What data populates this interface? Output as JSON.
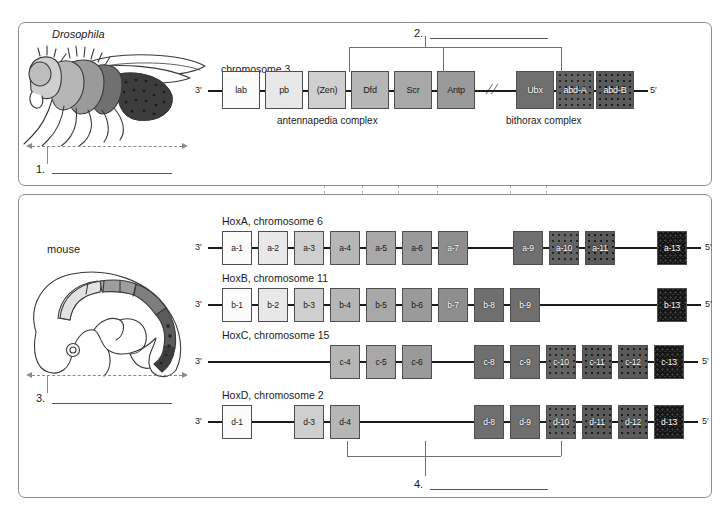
{
  "figure": {
    "title_caption": "",
    "organisms": {
      "fly": "Drosophila",
      "mouse": "mouse"
    }
  },
  "colors": {
    "stroke": "#4f4f4f",
    "guide": "#b5b5b5",
    "bracket": "#6f6f6f",
    "backbone": "#1b1b1b",
    "shade_1": "#fbfbfb",
    "shade_2": "#e8e8e8",
    "shade_3": "#cfcfcf",
    "shade_4": "#b6b6b6",
    "shade_5": "#a8a8a8",
    "shade_6": "#9a9a9a",
    "shade_7": "#8e8e8e",
    "shade_8": "#6f6f6f",
    "shade_9": "#636363",
    "shade_dot": "#5a5a5a",
    "shade_check": "#3a3a3a"
  },
  "fly_panel": {
    "organism_label": "Drosophila",
    "chromosome_label": "chromosome 3",
    "end_3": "3′",
    "end_5": "5′",
    "break_symbol": "//",
    "complexes": [
      {
        "name": "antennapedia complex"
      },
      {
        "name": "bithorax complex"
      }
    ],
    "genes": [
      {
        "label": "lab",
        "x": 222,
        "w": 38,
        "fill": "shade_1",
        "pattern": "solid",
        "light": true
      },
      {
        "label": "pb",
        "x": 265,
        "w": 38,
        "fill": "shade_2",
        "pattern": "solid",
        "light": true
      },
      {
        "label": "(Zen)",
        "x": 308,
        "w": 38,
        "fill": "shade_3",
        "pattern": "solid",
        "light": true
      },
      {
        "label": "Dfd",
        "x": 351,
        "w": 38,
        "fill": "shade_4",
        "pattern": "solid",
        "light": true
      },
      {
        "label": "Scr",
        "x": 394,
        "w": 38,
        "fill": "shade_5",
        "pattern": "solid",
        "light": true
      },
      {
        "label": "Antp",
        "x": 437,
        "w": 38,
        "fill": "shade_6",
        "pattern": "solid",
        "light": true
      },
      {
        "label": "Ubx",
        "x": 516,
        "w": 38,
        "fill": "shade_8",
        "pattern": "solid",
        "light": false
      },
      {
        "label": "abd-A",
        "x": 556,
        "w": 38,
        "fill": "shade_9",
        "pattern": "dots",
        "light": false
      },
      {
        "label": "abd-B",
        "x": 596,
        "w": 38,
        "fill": "shade_dot",
        "pattern": "dots2",
        "light": false
      }
    ]
  },
  "mouse_panel": {
    "organism_label": "mouse",
    "end_3": "3′",
    "end_5": "5′",
    "rows": [
      {
        "title": "HoxA, chromosome 6",
        "y": 248,
        "genes": [
          {
            "label": "a-1",
            "x": 222,
            "fill": "shade_1",
            "pattern": "solid",
            "light": true
          },
          {
            "label": "a-2",
            "x": 258,
            "fill": "shade_2",
            "pattern": "solid",
            "light": true
          },
          {
            "label": "a-3",
            "x": 294,
            "fill": "shade_3",
            "pattern": "solid",
            "light": true
          },
          {
            "label": "a-4",
            "x": 330,
            "fill": "shade_4",
            "pattern": "solid",
            "light": true
          },
          {
            "label": "a-5",
            "x": 366,
            "fill": "shade_5",
            "pattern": "solid",
            "light": true
          },
          {
            "label": "a-6",
            "x": 402,
            "fill": "shade_6",
            "pattern": "solid",
            "light": true
          },
          {
            "label": "a-7",
            "x": 438,
            "fill": "shade_7",
            "pattern": "solid",
            "light": false
          },
          {
            "label": "a-9",
            "x": 513,
            "fill": "shade_8",
            "pattern": "solid",
            "light": false
          },
          {
            "label": "a-10",
            "x": 549,
            "fill": "shade_9",
            "pattern": "dots",
            "light": false
          },
          {
            "label": "a-11",
            "x": 585,
            "fill": "shade_dot",
            "pattern": "dots2",
            "light": false
          },
          {
            "label": "a-13",
            "x": 657,
            "fill": "shade_check",
            "pattern": "check",
            "light": false
          }
        ]
      },
      {
        "title": "HoxB, chromosome 11",
        "y": 305,
        "genes": [
          {
            "label": "b-1",
            "x": 222,
            "fill": "shade_1",
            "pattern": "solid",
            "light": true
          },
          {
            "label": "b-2",
            "x": 258,
            "fill": "shade_2",
            "pattern": "solid",
            "light": true
          },
          {
            "label": "b-3",
            "x": 294,
            "fill": "shade_3",
            "pattern": "solid",
            "light": true
          },
          {
            "label": "b-4",
            "x": 330,
            "fill": "shade_4",
            "pattern": "solid",
            "light": true
          },
          {
            "label": "b-5",
            "x": 366,
            "fill": "shade_5",
            "pattern": "solid",
            "light": true
          },
          {
            "label": "b-6",
            "x": 402,
            "fill": "shade_6",
            "pattern": "solid",
            "light": true
          },
          {
            "label": "b-7",
            "x": 438,
            "fill": "shade_7",
            "pattern": "solid",
            "light": false
          },
          {
            "label": "b-8",
            "x": 474,
            "fill": "shade_8",
            "pattern": "solid",
            "light": false
          },
          {
            "label": "b-9",
            "x": 510,
            "fill": "shade_8",
            "pattern": "solid",
            "light": false
          },
          {
            "label": "b-13",
            "x": 657,
            "fill": "shade_check",
            "pattern": "check",
            "light": false
          }
        ]
      },
      {
        "title": "HoxC, chromosome 15",
        "y": 362,
        "genes": [
          {
            "label": "c-4",
            "x": 330,
            "fill": "shade_4",
            "pattern": "solid",
            "light": true
          },
          {
            "label": "c-5",
            "x": 366,
            "fill": "shade_5",
            "pattern": "solid",
            "light": true
          },
          {
            "label": "c-6",
            "x": 402,
            "fill": "shade_6",
            "pattern": "solid",
            "light": true
          },
          {
            "label": "c-8",
            "x": 474,
            "fill": "shade_8",
            "pattern": "solid",
            "light": false
          },
          {
            "label": "c-9",
            "x": 510,
            "fill": "shade_8",
            "pattern": "solid",
            "light": false
          },
          {
            "label": "c-10",
            "x": 546,
            "fill": "shade_9",
            "pattern": "dots",
            "light": false
          },
          {
            "label": "c-11",
            "x": 582,
            "fill": "shade_dot",
            "pattern": "dots2",
            "light": false
          },
          {
            "label": "c-12",
            "x": 618,
            "fill": "shade_dot",
            "pattern": "dots2",
            "light": false
          },
          {
            "label": "c-13",
            "x": 654,
            "fill": "shade_check",
            "pattern": "check",
            "light": false
          }
        ]
      },
      {
        "title": "HoxD, chromosome 2",
        "y": 422,
        "genes": [
          {
            "label": "d-1",
            "x": 222,
            "fill": "shade_1",
            "pattern": "solid",
            "light": true
          },
          {
            "label": "d-3",
            "x": 294,
            "fill": "shade_3",
            "pattern": "solid",
            "light": true
          },
          {
            "label": "d-4",
            "x": 330,
            "fill": "shade_4",
            "pattern": "solid",
            "light": true
          },
          {
            "label": "d-8",
            "x": 474,
            "fill": "shade_8",
            "pattern": "solid",
            "light": false
          },
          {
            "label": "d-9",
            "x": 510,
            "fill": "shade_8",
            "pattern": "solid",
            "light": false
          },
          {
            "label": "d-10",
            "x": 546,
            "fill": "shade_9",
            "pattern": "dots",
            "light": false
          },
          {
            "label": "d-11",
            "x": 582,
            "fill": "shade_dot",
            "pattern": "dots2",
            "light": false
          },
          {
            "label": "d-12",
            "x": 618,
            "fill": "shade_dot",
            "pattern": "dots2",
            "light": false
          },
          {
            "label": "d-13",
            "x": 654,
            "fill": "shade_check",
            "pattern": "check",
            "light": false
          }
        ]
      }
    ]
  },
  "answer_blanks": [
    {
      "number": "1.",
      "x": 36,
      "y": 163,
      "line_x": 52,
      "line_y": 173,
      "line_w": 120
    },
    {
      "number": "2.",
      "x": 414,
      "y": 27,
      "line_x": 430,
      "line_y": 38,
      "line_w": 118
    },
    {
      "number": "3.",
      "x": 36,
      "y": 392,
      "line_x": 52,
      "line_y": 403,
      "line_w": 120
    },
    {
      "number": "4.",
      "x": 414,
      "y": 478,
      "line_x": 430,
      "line_y": 489,
      "line_w": 118
    }
  ],
  "guides": {
    "x_positions": [
      324,
      362,
      398,
      437,
      510,
      546
    ]
  }
}
